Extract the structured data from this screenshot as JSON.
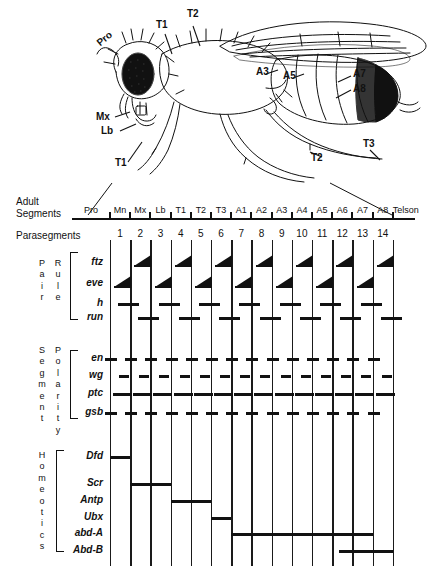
{
  "figure": {
    "organism_labels": [
      {
        "name": "Pro",
        "x": 98,
        "y": 38,
        "rot": -38
      },
      {
        "name": "T1",
        "x": 157,
        "y": 24,
        "rot": 0
      },
      {
        "name": "T2",
        "x": 188,
        "y": 13,
        "rot": 0
      },
      {
        "name": "A3",
        "x": 256,
        "y": 66,
        "rot": 0
      },
      {
        "name": "A5",
        "x": 283,
        "y": 70,
        "rot": 0
      },
      {
        "name": "A7",
        "x": 340,
        "y": 68,
        "rot": 0
      },
      {
        "name": "A8",
        "x": 340,
        "y": 82,
        "rot": 0
      },
      {
        "name": "Mx",
        "x": 107,
        "y": 112,
        "rot": 0
      },
      {
        "name": "Lb",
        "x": 112,
        "y": 126,
        "rot": 0
      },
      {
        "name": "T1",
        "x": 117,
        "y": 164,
        "rot": 0
      },
      {
        "name": "T2",
        "x": 313,
        "y": 155,
        "rot": 0
      },
      {
        "name": "T3",
        "x": 363,
        "y": 142,
        "rot": 0
      }
    ],
    "rows": {
      "adult_segments_label_line1": "Adult",
      "adult_segments_label_line2": "Segments",
      "parasegments_label": "Parasegments"
    },
    "adult_segments": [
      "Pro",
      "Mn",
      "Mx",
      "Lb",
      "T1",
      "T2",
      "T3",
      "A1",
      "A2",
      "A3",
      "A4",
      "A5",
      "A6",
      "A7",
      "A8",
      "Telson"
    ],
    "parasegments": [
      "1",
      "2",
      "3",
      "4",
      "5",
      "6",
      "7",
      "8",
      "9",
      "10",
      "11",
      "12",
      "13",
      "14"
    ],
    "groups": [
      {
        "name_col1": "Pair",
        "name_col2": "Rule",
        "genes": [
          "ftz",
          "eve",
          "h",
          "run"
        ]
      },
      {
        "name_col1": "Segment",
        "name_col2": "Polarity",
        "genes": [
          "en",
          "wg",
          "ptc",
          "gsb"
        ]
      },
      {
        "name_col1": "Homeotics",
        "name_col2": "",
        "genes": [
          "Dfd",
          "Scr",
          "Antp",
          "Ubx",
          "abd-A",
          "Abd-B"
        ]
      }
    ],
    "colors": {
      "ink": "#111111",
      "paper": "#ffffff",
      "grid": "#1a1a1a"
    }
  },
  "chart_data": {
    "type": "table",
    "xlabel": "Parasegments",
    "ylabel": "Genes",
    "categories": [
      "1",
      "2",
      "3",
      "4",
      "5",
      "6",
      "7",
      "8",
      "9",
      "10",
      "11",
      "12",
      "13",
      "14"
    ],
    "series": [
      {
        "name": "ftz",
        "pattern": "pair-rule stripe, even parasegments",
        "stripes": [
          2,
          4,
          6,
          8,
          10,
          12,
          14
        ]
      },
      {
        "name": "eve",
        "pattern": "pair-rule stripe, odd parasegments",
        "stripes": [
          1,
          3,
          5,
          7,
          9,
          11,
          13
        ]
      },
      {
        "name": "h",
        "pattern": "pair-rule stripe, odd parasegment boundaries",
        "stripes": [
          1,
          3,
          5,
          7,
          9,
          11,
          13
        ]
      },
      {
        "name": "run",
        "pattern": "pair-rule stripe, even parasegment boundaries",
        "stripes": [
          2,
          4,
          6,
          8,
          10,
          12,
          14
        ]
      },
      {
        "name": "en",
        "pattern": "segment polarity, every parasegment anterior border",
        "stripes": [
          1,
          2,
          3,
          4,
          5,
          6,
          7,
          8,
          9,
          10,
          11,
          12,
          13,
          14
        ]
      },
      {
        "name": "wg",
        "pattern": "segment polarity, every parasegment posterior of en",
        "stripes": [
          1,
          2,
          3,
          4,
          5,
          6,
          7,
          8,
          9,
          10,
          11,
          12,
          13,
          14
        ]
      },
      {
        "name": "ptc",
        "pattern": "segment polarity, broad band each parasegment",
        "stripes": [
          1,
          2,
          3,
          4,
          5,
          6,
          7,
          8,
          9,
          10,
          11,
          12,
          13,
          14
        ]
      },
      {
        "name": "gsb",
        "pattern": "segment polarity, every parasegment",
        "stripes": [
          1,
          2,
          3,
          4,
          5,
          6,
          7,
          8,
          9,
          10,
          11,
          12,
          13,
          14
        ]
      },
      {
        "name": "Dfd",
        "pattern": "homeotic domain",
        "domain": [
          0,
          1
        ]
      },
      {
        "name": "Scr",
        "pattern": "homeotic domain",
        "domain": [
          1,
          3
        ]
      },
      {
        "name": "Antp",
        "pattern": "homeotic domain",
        "domain": [
          3,
          5
        ]
      },
      {
        "name": "Ubx",
        "pattern": "homeotic domain",
        "domain": [
          5,
          6
        ]
      },
      {
        "name": "abd-A",
        "pattern": "homeotic domain",
        "domain": [
          6,
          13
        ]
      },
      {
        "name": "Abd-B",
        "pattern": "homeotic domain",
        "domain": [
          11,
          14
        ]
      }
    ]
  }
}
